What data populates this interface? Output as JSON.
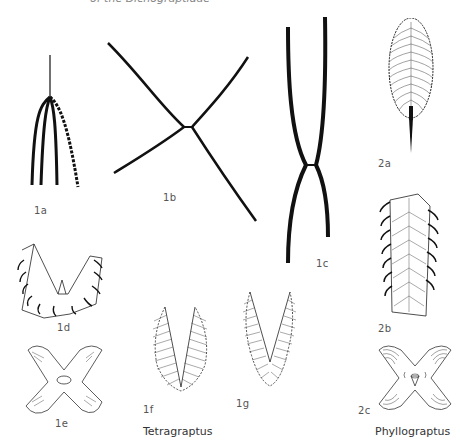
{
  "figure": {
    "clipped_caption": "of the Dichograptidae",
    "panels": [
      {
        "id": "1a",
        "label": "1a"
      },
      {
        "id": "1b",
        "label": "1b"
      },
      {
        "id": "1c",
        "label": "1c"
      },
      {
        "id": "1d",
        "label": "1d"
      },
      {
        "id": "1e",
        "label": "1e"
      },
      {
        "id": "1f",
        "label": "1f"
      },
      {
        "id": "1g",
        "label": "1g"
      },
      {
        "id": "2a",
        "label": "2a"
      },
      {
        "id": "2b",
        "label": "2b"
      },
      {
        "id": "2c",
        "label": "2c"
      }
    ],
    "genera": {
      "tetragraptus": "Tetragraptus",
      "phyllograptus": "Phyllograptus"
    },
    "colors": {
      "ink": "#111111",
      "label": "#555555",
      "background": "#ffffff"
    }
  }
}
